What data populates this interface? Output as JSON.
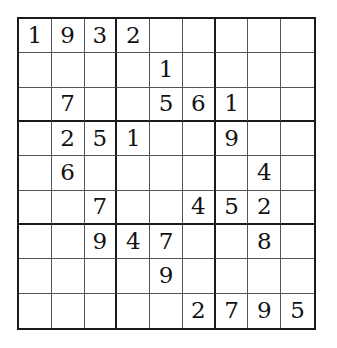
{
  "puzzle": {
    "type": "sudoku",
    "size": 9,
    "box_size": 3,
    "grid": [
      [
        "1",
        "9",
        "3",
        "2",
        "",
        "",
        "",
        "",
        ""
      ],
      [
        "",
        "",
        "",
        "",
        "1",
        "",
        "",
        "",
        ""
      ],
      [
        "",
        "7",
        "",
        "",
        "5",
        "6",
        "1",
        "",
        ""
      ],
      [
        "",
        "2",
        "5",
        "1",
        "",
        "",
        "9",
        "",
        ""
      ],
      [
        "",
        "6",
        "",
        "",
        "",
        "",
        "",
        "4",
        ""
      ],
      [
        "",
        "",
        "7",
        "",
        "",
        "4",
        "5",
        "2",
        ""
      ],
      [
        "",
        "",
        "9",
        "4",
        "7",
        "",
        "",
        "8",
        ""
      ],
      [
        "",
        "",
        "",
        "",
        "9",
        "",
        "",
        "",
        ""
      ],
      [
        "",
        "",
        "",
        "",
        "",
        "2",
        "7",
        "9",
        "5"
      ]
    ]
  },
  "colors": {
    "background": "#ffffff",
    "grid_line": "#555555",
    "box_line": "#1a1a1a",
    "digit": "#111111"
  }
}
